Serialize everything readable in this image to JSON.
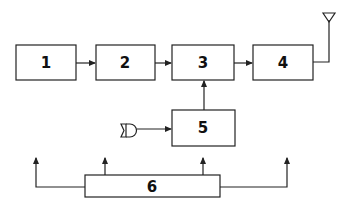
{
  "diagram": {
    "blocks": [
      {
        "id": "1",
        "label": "1"
      },
      {
        "id": "2",
        "label": "2"
      },
      {
        "id": "3",
        "label": "3"
      },
      {
        "id": "4",
        "label": "4"
      },
      {
        "id": "5",
        "label": "5"
      },
      {
        "id": "6",
        "label": "6"
      }
    ],
    "connections": [
      {
        "from": "1",
        "to": "2"
      },
      {
        "from": "2",
        "to": "3"
      },
      {
        "from": "3",
        "to": "4"
      },
      {
        "from": "4",
        "to": "antenna"
      },
      {
        "from": "microphone",
        "to": "5"
      },
      {
        "from": "5",
        "to": "3"
      },
      {
        "from": "6",
        "to": "outputs",
        "count": 4
      }
    ],
    "icons": [
      "antenna-icon",
      "microphone-icon"
    ],
    "colors": {
      "stroke": "#222222",
      "background": "#ffffff"
    }
  }
}
